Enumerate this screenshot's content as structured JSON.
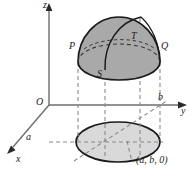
{
  "figure": {
    "type": "3d-geometry-diagram",
    "axes": {
      "z_label": "z",
      "y_label": "y",
      "x_label": "x",
      "origin_label": "O"
    },
    "axis_marks": {
      "a_label": "a",
      "b_label": "b"
    },
    "points": {
      "P": "P",
      "Q": "Q",
      "T": "T",
      "S": "S"
    },
    "coordinate_label": "(a, b, 0)",
    "colors": {
      "dome_fill": "#a9a9a9",
      "dome_stroke": "#1a1a1a",
      "base_fill": "#d9d9d9",
      "base_stroke": "#1a1a1a",
      "axis_stroke": "#6e6e6e",
      "dashed_stroke": "#8a8a8a",
      "text": "#1a1a1a"
    },
    "geometry": {
      "z_axis_top": 5,
      "origin_x": 49,
      "origin_y": 105,
      "y_axis_end_x": 185,
      "x_axis_end": [
        8,
        152
      ],
      "dome_center": [
        119,
        60
      ],
      "dome_rx": 41,
      "dome_ry": 18,
      "dome_height": 45,
      "base_center": [
        118,
        142
      ],
      "base_rx": 42,
      "base_ry": 20,
      "vertical_dash_x": [
        78,
        105,
        140,
        160
      ]
    }
  }
}
